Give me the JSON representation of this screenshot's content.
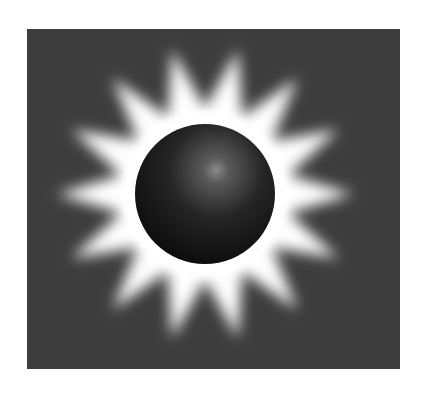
{
  "image": {
    "subject": "eclipse-sun-illustration",
    "background_color": "#ffffff",
    "panel_color": "#3d3d3d",
    "corona_color": "#ffffff",
    "sphere_color": "#111111",
    "ray_count": 14
  }
}
